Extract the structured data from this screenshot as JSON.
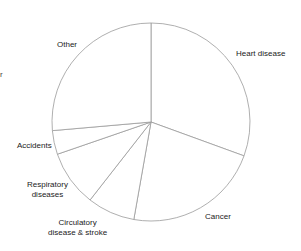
{
  "chart_data": {
    "type": "pie",
    "title": "",
    "center": [
      151,
      122
    ],
    "radius": 99,
    "start_angle_deg": -90,
    "direction": "clockwise",
    "stroke_color": "#9a9a9a",
    "fill_color": "#ffffff",
    "slices": [
      {
        "label": "Heart disease",
        "degrees": 110,
        "percent": 30.6
      },
      {
        "label": "Cancer",
        "degrees": 80,
        "percent": 22.2
      },
      {
        "label": "Circulatory disease & stroke",
        "degrees": 28,
        "percent": 7.8
      },
      {
        "label": "Respiratory diseases",
        "degrees": 33,
        "percent": 9.2
      },
      {
        "label": "Accidents",
        "degrees": 14,
        "percent": 3.9
      },
      {
        "label": "Other",
        "degrees": 95,
        "percent": 26.4
      }
    ]
  },
  "labels": {
    "heart": "Heart disease",
    "cancer": "Cancer",
    "circ_1": "Circulatory",
    "circ_2": "disease & stroke",
    "resp_1": "Respiratory",
    "resp_2": "diseases",
    "accidents": "Accidents",
    "other": "Other",
    "left_edge_fragment": "r"
  }
}
